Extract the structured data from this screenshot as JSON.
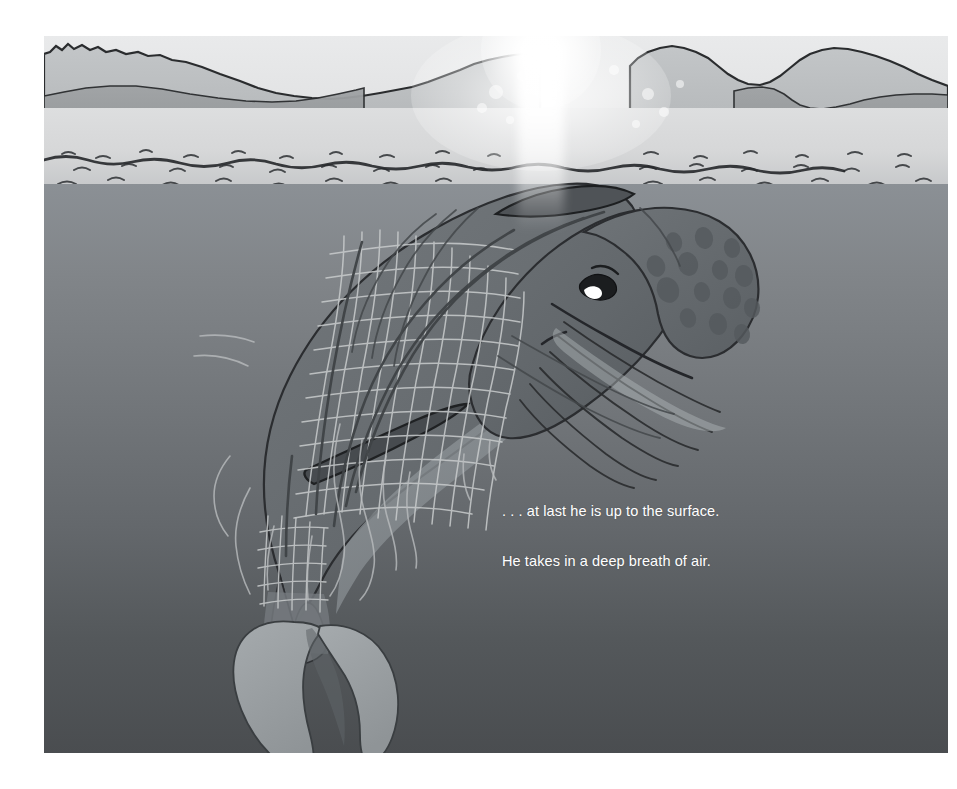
{
  "page": {
    "background_color": "#ffffff",
    "width": 957,
    "height": 789
  },
  "illustration": {
    "name": "whale-entangled-in-fishing-net-at-ocean-surface",
    "frame": {
      "x": 44,
      "y": 36,
      "width": 904,
      "height": 717
    },
    "scene_description": "A humpback whale tangled in a drifting fishing net rises nose-first to the ocean surface at sunrise, with distant mountain ridges on the horizon and a bright sun flare reflected on the water.",
    "sky": {
      "label": "dawn sky",
      "color_top": "#e9eaeb",
      "color_bottom": "#dcdddd"
    },
    "sun": {
      "label": "sun glare on horizon",
      "center_x": 541,
      "center_y": 50,
      "color": "#ffffff",
      "flare_bokeh_count": 9
    },
    "mountains": [
      {
        "label": "far mountain ridge",
        "color": "#b9bcbe"
      },
      {
        "label": "near mountain ridge",
        "color": "#949799"
      }
    ],
    "water": {
      "surface_label": "sunlit water surface with ripples",
      "surface_color_top": "#dddedf",
      "surface_color_bottom": "#a9acaf",
      "deep_label": "deep water gradient",
      "deep_color_top": "#8b9095",
      "deep_color_bottom": "#4a4d50",
      "ripple_rows": 7,
      "wave_lines": 4
    },
    "whale": {
      "label": "humpback whale",
      "body_color": "#6a6f73",
      "belly_color": "#8a8f93",
      "head_color": "#5f6468",
      "fluke_color": "#9ba0a3",
      "eye": {
        "label": "whale eye",
        "expression": "strained",
        "iris_color": "#1b1d1f",
        "highlight_color": "#ffffff"
      },
      "rostrum_spots": {
        "label": "tubercle spots on rostrum",
        "count": 14,
        "color": "#585d61"
      },
      "throat_pleats": {
        "label": "throat pleat lines",
        "count": 6,
        "color": "#2a2c2e"
      },
      "tail_fluke": {
        "label": "tail fluke",
        "shape": "notched crescent"
      },
      "pectoral_fin": {
        "label": "pectoral fin",
        "color": "#4c5054"
      }
    },
    "net": {
      "label": "fishing net entangling the whale",
      "mesh_color": "#c9cccd",
      "rope_color": "#4e5255",
      "loose_strand_count": 12,
      "description": "A fine-mesh drift net wrapped around the whale's body and tail stock with loose trailing strands."
    }
  },
  "caption": {
    "lines": [
      ". . . at last he is up to the surface.",
      "He takes in a deep breath of air."
    ],
    "color": "#ffffff",
    "font_size_px": 14.5
  }
}
